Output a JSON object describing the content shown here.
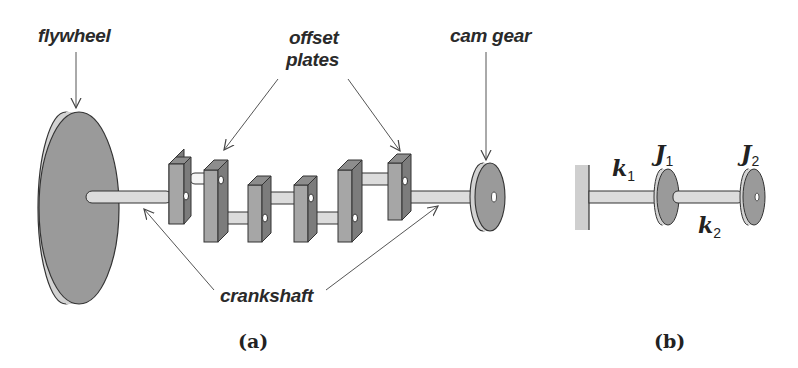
{
  "figure_a": {
    "caption": "(a)",
    "labels": {
      "flywheel": "flywheel",
      "offset_plates_line1": "offset",
      "offset_plates_line2": "plates",
      "cam_gear": "cam gear",
      "crankshaft": "crankshaft"
    }
  },
  "figure_b": {
    "caption": "(b)",
    "symbols": {
      "k1": {
        "base": "k",
        "sub": "1"
      },
      "k2": {
        "base": "k",
        "sub": "2"
      },
      "J1": {
        "base": "J",
        "sub": "1"
      },
      "J2": {
        "base": "J",
        "sub": "2"
      }
    }
  },
  "colors": {
    "face": "#9a9a9a",
    "rim": "#d2d2d2",
    "shaft": "#dcdcdc",
    "plate_front": "#a6a6a6",
    "plate_side": "#7c7c7c",
    "outline": "#333333",
    "wall": "#cfcfcf"
  }
}
